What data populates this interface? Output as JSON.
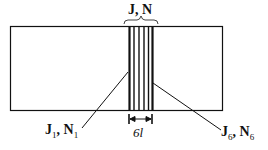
{
  "diagram": {
    "top_label": "J, N",
    "left_label": {
      "main_j": "J",
      "sub_j": "1",
      "main_n": "N",
      "sub_n": "1"
    },
    "right_label": {
      "main_j": "J",
      "sub_j": "6",
      "main_n": "N",
      "sub_n": "6"
    },
    "width_label_num": "6",
    "width_label_var": "l",
    "layer_count": 6
  }
}
